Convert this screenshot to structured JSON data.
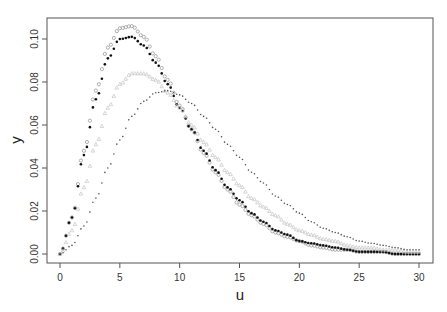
{
  "chart_data": {
    "type": "scatter",
    "title": "",
    "xlabel": "u",
    "ylabel": "y",
    "xlim": [
      0,
      30
    ],
    "ylim": [
      0,
      0.11
    ],
    "grid": false,
    "legend": null,
    "x_ticks": [
      "0",
      "5",
      "10",
      "15",
      "20",
      "25",
      "30"
    ],
    "y_ticks": [
      "0.00",
      "0.02",
      "0.04",
      "0.06",
      "0.08",
      "0.10"
    ],
    "x": [
      0,
      1,
      2,
      3,
      4,
      5,
      6,
      7,
      8,
      9,
      10,
      11,
      12,
      13,
      14,
      15,
      16,
      17,
      18,
      19,
      20,
      21,
      22,
      23,
      24,
      25,
      26,
      27,
      28,
      29,
      30
    ],
    "series": [
      {
        "name": "series-1-hollow-circles",
        "marker": "open-circle",
        "color": "#9a9a9a",
        "values": [
          0.0,
          0.017,
          0.048,
          0.076,
          0.096,
          0.105,
          0.106,
          0.101,
          0.092,
          0.081,
          0.069,
          0.058,
          0.047,
          0.038,
          0.03,
          0.023,
          0.018,
          0.014,
          0.01,
          0.008,
          0.006,
          0.004,
          0.003,
          0.002,
          0.002,
          0.001,
          0.001,
          0.001,
          0.0,
          0.0,
          0.0
        ]
      },
      {
        "name": "series-2-filled-dots",
        "marker": "filled-circle",
        "color": "#111111",
        "values": [
          0.0,
          0.017,
          0.046,
          0.072,
          0.091,
          0.1,
          0.101,
          0.097,
          0.089,
          0.079,
          0.068,
          0.058,
          0.048,
          0.039,
          0.031,
          0.025,
          0.019,
          0.015,
          0.011,
          0.009,
          0.006,
          0.005,
          0.004,
          0.003,
          0.002,
          0.001,
          0.001,
          0.001,
          0.0,
          0.0,
          0.0
        ]
      },
      {
        "name": "series-3-light-triangles",
        "marker": "open-triangle",
        "color": "#c4c4c4",
        "values": [
          0.0,
          0.011,
          0.031,
          0.051,
          0.068,
          0.079,
          0.084,
          0.084,
          0.081,
          0.075,
          0.068,
          0.06,
          0.052,
          0.045,
          0.038,
          0.032,
          0.026,
          0.022,
          0.018,
          0.014,
          0.011,
          0.009,
          0.007,
          0.006,
          0.004,
          0.003,
          0.003,
          0.002,
          0.002,
          0.001,
          0.001
        ]
      },
      {
        "name": "series-4-small-dots",
        "marker": "small-dot",
        "color": "#555555",
        "values": [
          0.0,
          0.004,
          0.013,
          0.026,
          0.04,
          0.053,
          0.064,
          0.071,
          0.075,
          0.076,
          0.074,
          0.07,
          0.064,
          0.058,
          0.051,
          0.045,
          0.038,
          0.033,
          0.027,
          0.023,
          0.019,
          0.015,
          0.012,
          0.01,
          0.008,
          0.006,
          0.005,
          0.004,
          0.003,
          0.002,
          0.002
        ]
      }
    ]
  }
}
